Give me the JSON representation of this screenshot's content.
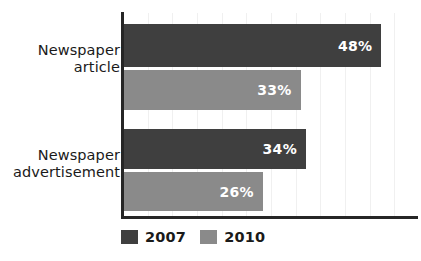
{
  "chart_data": {
    "type": "bar",
    "orientation": "horizontal",
    "title": "",
    "subtitle": "",
    "xlabel": "",
    "ylabel": "",
    "categories": [
      "Newspaper\narticle",
      "Newspaper\nadvertisement"
    ],
    "series": [
      {
        "name": "2007",
        "color": "#3f3f3f",
        "values": [
          48,
          34
        ],
        "labels": [
          "48%",
          "34%"
        ]
      },
      {
        "name": "2010",
        "color": "#8a8a8a",
        "values": [
          33,
          26
        ],
        "labels": [
          "33%",
          "26%"
        ]
      }
    ],
    "value_suffix": "%",
    "xlim": [
      0,
      55
    ],
    "grid": true,
    "grid_orientation": "vertical",
    "grid_count": 11,
    "legend_position": "bottom-left",
    "axis_color": "#262626",
    "background_color": "#ffffff"
  },
  "legend": {
    "items": [
      {
        "label": "2007",
        "color": "#3f3f3f"
      },
      {
        "label": "2010",
        "color": "#8a8a8a"
      }
    ]
  }
}
